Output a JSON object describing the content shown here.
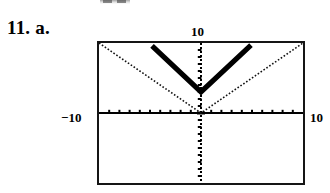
{
  "problem": {
    "number": "11.",
    "part": "a."
  },
  "artifact": {
    "name": "clipped-text-fragment",
    "visible": true
  },
  "calculator_screen": {
    "frame_color": "#151515",
    "background": "#ffffff",
    "labels": {
      "y_max": "10",
      "x_min": "−10",
      "x_max": "10"
    }
  },
  "chart_data": {
    "type": "line",
    "title": "",
    "subtitle": "",
    "xlabel": "",
    "ylabel": "",
    "xlim": [
      -10,
      10
    ],
    "ylim": [
      -10,
      10
    ],
    "grid": false,
    "legend": "none",
    "axis_style": "dotted-tick-marks",
    "x_tick_interval": 1,
    "y_tick_interval": 1,
    "x_tick_labels": [
      "-10",
      "10"
    ],
    "y_tick_labels": [
      "10"
    ],
    "annotations": [],
    "series": [
      {
        "name": "y = |x|",
        "style": "thin-dotted",
        "vertex": [
          0,
          0
        ],
        "slope": 1,
        "x": [
          -10,
          0,
          10
        ],
        "values": [
          10,
          0,
          10
        ]
      },
      {
        "name": "y = 2|x| + 3",
        "style": "thick-solid",
        "vertex": [
          0,
          3
        ],
        "slope": 2,
        "x": [
          -4.8,
          0,
          4.9
        ],
        "values": [
          12.6,
          3,
          12.8
        ],
        "x_clipped": [
          -4.8,
          0,
          4.9
        ],
        "values_clipped": [
          9.6,
          3,
          9.7
        ]
      }
    ]
  }
}
